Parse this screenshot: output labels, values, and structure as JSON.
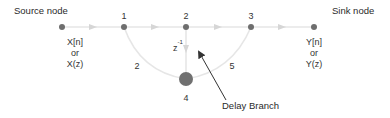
{
  "title_labels": {
    "source": "Source node",
    "sink": "Sink node"
  },
  "nodes": {
    "n1": "1",
    "n2": "2",
    "n3": "3",
    "n4": "4"
  },
  "input_signal": [
    "X[n]",
    "or",
    "X(z)"
  ],
  "output_signal": [
    "Y[n]",
    "or",
    "Y(z)"
  ],
  "branches": {
    "left_arc_gain": "2",
    "right_arc_gain": "5",
    "delay_gain_base": "z",
    "delay_gain_exp": "-1"
  },
  "annotation": {
    "delay_branch": "Delay Branch"
  },
  "colors": {
    "node": "#6b6b6b",
    "branch": "#e3e3e3",
    "arrow_head": "#d0d0d0",
    "pointer": "#333333"
  }
}
